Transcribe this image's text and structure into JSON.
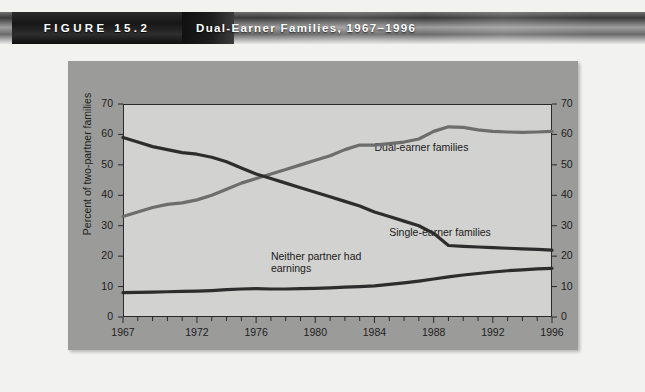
{
  "header": {
    "figure_tag": "FIGURE 15.2",
    "title": "Dual-Earner Families, 1967–1996"
  },
  "chart_data": {
    "type": "line",
    "title": "Dual-Earner Families, 1967–1996",
    "xlabel": "",
    "ylabel": "Percent of two-partner families",
    "xlim": [
      1967,
      1996
    ],
    "ylim": [
      0,
      70
    ],
    "ytick_interval": 10,
    "yticks": [
      0,
      10,
      20,
      30,
      40,
      50,
      60,
      70
    ],
    "yticks_right": [
      0,
      10,
      20,
      30,
      40,
      50,
      60,
      70
    ],
    "xticks_labeled": [
      1967,
      1972,
      1976,
      1980,
      1984,
      1988,
      1992,
      1996
    ],
    "xticks_minor_every": 1,
    "grid": false,
    "legend_position": "inline-annotations",
    "x": [
      1967,
      1968,
      1969,
      1970,
      1971,
      1972,
      1973,
      1974,
      1975,
      1976,
      1977,
      1978,
      1979,
      1980,
      1981,
      1982,
      1983,
      1984,
      1985,
      1986,
      1987,
      1988,
      1989,
      1990,
      1991,
      1992,
      1993,
      1994,
      1995,
      1996
    ],
    "series": [
      {
        "name": "Dual-earner families",
        "color": "#6d6d6d",
        "values": [
          33,
          34.5,
          36,
          37,
          37.5,
          38.5,
          40,
          42,
          44,
          45.5,
          47,
          48.5,
          50,
          51.5,
          53,
          55,
          56.5,
          56.5,
          57,
          57.5,
          58.5,
          61,
          62.5,
          62.3,
          61.5,
          61,
          60.8,
          60.7,
          60.8,
          61
        ]
      },
      {
        "name": "Single-earner families",
        "color": "#2d2d2d",
        "values": [
          59,
          57.5,
          56,
          55,
          54,
          53.5,
          52.5,
          51,
          49,
          47,
          45.5,
          44,
          42.5,
          41,
          39.5,
          38,
          36.5,
          34.5,
          33,
          31.5,
          30,
          27.5,
          23.5,
          23.2,
          23,
          22.8,
          22.6,
          22.4,
          22.2,
          22
        ]
      },
      {
        "name": "Neither partner had earnings",
        "color": "#2d2d2d",
        "values": [
          8,
          8.1,
          8.2,
          8.3,
          8.4,
          8.5,
          8.7,
          9,
          9.2,
          9.3,
          9.2,
          9.2,
          9.3,
          9.4,
          9.6,
          9.8,
          10,
          10.2,
          10.7,
          11.2,
          11.8,
          12.5,
          13.2,
          13.8,
          14.3,
          14.8,
          15.2,
          15.5,
          15.8,
          16
        ]
      }
    ],
    "annotations": [
      {
        "text": "Dual-earner families",
        "x": 1984,
        "y": 56
      },
      {
        "text": "Single-earner families",
        "x": 1985,
        "y": 28
      },
      {
        "text": "Neither partner had\nearnings",
        "x": 1977,
        "y": 20
      }
    ]
  }
}
